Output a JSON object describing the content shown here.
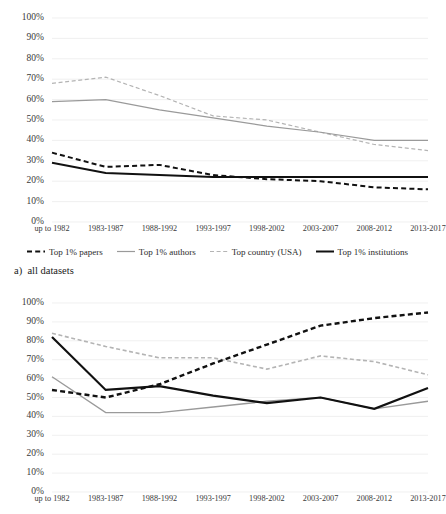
{
  "figure": {
    "caption_a": "a)  all datasets"
  },
  "legend": {
    "position": "bottom-center",
    "items": [
      {
        "label": "Top 1% papers",
        "color": "#111111",
        "style": "dashed",
        "width": 2.0
      },
      {
        "label": "Top 1% authors",
        "color": "#9a9a9a",
        "style": "solid",
        "width": 1.2
      },
      {
        "label": "Top country (USA)",
        "color": "#b4b4b4",
        "style": "dashed",
        "width": 1.2
      },
      {
        "label": "Top 1% institutions",
        "color": "#111111",
        "style": "solid",
        "width": 2.0
      }
    ]
  },
  "chart_data": [
    {
      "id": "chart-a",
      "type": "line",
      "title": "",
      "xlabel": "",
      "ylabel": "",
      "ylim": [
        0,
        100
      ],
      "yticks": [
        0,
        10,
        20,
        30,
        40,
        50,
        60,
        70,
        80,
        90,
        100
      ],
      "ytick_labels": [
        "0%",
        "10%",
        "20%",
        "30%",
        "40%",
        "50%",
        "60%",
        "70%",
        "80%",
        "90%",
        "100%"
      ],
      "grid": true,
      "categories": [
        "up to 1982",
        "1983-1987",
        "1988-1992",
        "1993-1997",
        "1998-2002",
        "2003-2007",
        "2008-2012",
        "2013-2017"
      ],
      "series": [
        {
          "name": "Top 1% papers",
          "color": "#111111",
          "style": "dashed",
          "width": 2.0,
          "values": [
            34,
            27,
            28,
            23,
            21,
            20,
            17,
            16
          ]
        },
        {
          "name": "Top 1% authors",
          "color": "#9a9a9a",
          "style": "solid",
          "width": 1.2,
          "values": [
            59,
            60,
            55,
            51,
            47,
            44,
            40,
            40
          ]
        },
        {
          "name": "Top country (USA)",
          "color": "#b4b4b4",
          "style": "dashed",
          "width": 1.2,
          "values": [
            68,
            71,
            62,
            52,
            50,
            44,
            38,
            35
          ]
        },
        {
          "name": "Top 1% institutions",
          "color": "#111111",
          "style": "solid",
          "width": 2.0,
          "values": [
            29,
            24,
            23,
            22,
            22,
            22,
            22,
            22
          ]
        }
      ]
    },
    {
      "id": "chart-b",
      "type": "line",
      "title": "",
      "xlabel": "",
      "ylabel": "",
      "ylim": [
        0,
        100
      ],
      "yticks": [
        0,
        10,
        20,
        30,
        40,
        50,
        60,
        70,
        80,
        90,
        100
      ],
      "ytick_labels": [
        "0%",
        "10%",
        "20%",
        "30%",
        "40%",
        "50%",
        "60%",
        "70%",
        "80%",
        "90%",
        "100%"
      ],
      "grid": true,
      "categories": [
        "up to 1982",
        "1983-1987",
        "1988-1992",
        "1993-1997",
        "1998-2002",
        "2003-2007",
        "2008-2012",
        "2013-2017"
      ],
      "series": [
        {
          "name": "Top 1% papers",
          "color": "#111111",
          "style": "dashed",
          "width": 2.4,
          "values": [
            54,
            50,
            57,
            68,
            78,
            88,
            92,
            95
          ]
        },
        {
          "name": "Top 1% authors",
          "color": "#9a9a9a",
          "style": "solid",
          "width": 1.4,
          "values": [
            61,
            42,
            42,
            45,
            48,
            50,
            44,
            48
          ]
        },
        {
          "name": "Top country (USA)",
          "color": "#b4b4b4",
          "style": "dashed",
          "width": 1.6,
          "values": [
            84,
            77,
            71,
            71,
            65,
            72,
            69,
            62
          ]
        },
        {
          "name": "Top 1% institutions",
          "color": "#111111",
          "style": "solid",
          "width": 2.2,
          "values": [
            82,
            54,
            56,
            51,
            47,
            50,
            44,
            55
          ]
        }
      ]
    }
  ]
}
